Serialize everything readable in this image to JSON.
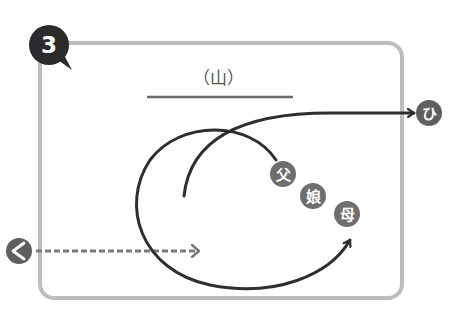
{
  "step_badge": {
    "number": "3"
  },
  "title": {
    "text": "（山）"
  },
  "circles": {
    "exit_right": "ひ",
    "father": "父",
    "daughter": "娘",
    "mother": "母",
    "left": "<"
  },
  "colors": {
    "badge": "#2b2b2b",
    "box_border": "#bdbdbd",
    "circle_fill": "#6e6e6e",
    "line": "#2e2e2e",
    "dashed": "#7a7a7a"
  }
}
